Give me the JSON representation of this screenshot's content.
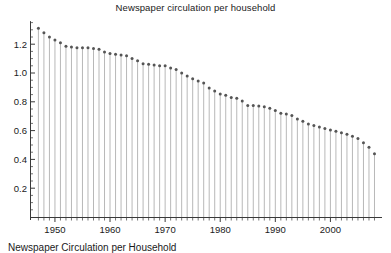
{
  "chart_data": {
    "type": "line",
    "plot_style": "stem",
    "title": "Newspaper circulation per household",
    "xlabel": "",
    "ylabel": "",
    "xlim": [
      1946.2,
      2009.0
    ],
    "ylim": [
      0,
      1.36
    ],
    "grid": false,
    "legend": null,
    "xticks": [
      1950,
      1960,
      1970,
      1980,
      1990,
      2000
    ],
    "xtick_labels": [
      "1950",
      "1960",
      "1970",
      "1980",
      "1990",
      "2000"
    ],
    "x_minor_tick_interval": 1,
    "yticks": [
      0.2,
      0.4,
      0.6,
      0.8,
      1.0,
      1.2
    ],
    "ytick_labels": [
      "0.2",
      "0.4",
      "0.6",
      "0.8",
      "1.0",
      "1.2"
    ],
    "y_minor_tick_interval": 0.05,
    "marker": "circle",
    "marker_color": "#555555",
    "stem_color": "#b0b0b0",
    "axis_color": "#3a3a3a",
    "x": [
      1947,
      1948,
      1949,
      1950,
      1951,
      1952,
      1953,
      1954,
      1955,
      1956,
      1957,
      1958,
      1959,
      1960,
      1961,
      1962,
      1963,
      1964,
      1965,
      1966,
      1967,
      1968,
      1969,
      1970,
      1971,
      1972,
      1973,
      1974,
      1975,
      1976,
      1977,
      1978,
      1979,
      1980,
      1981,
      1982,
      1983,
      1984,
      1985,
      1986,
      1987,
      1988,
      1989,
      1990,
      1991,
      1992,
      1993,
      1994,
      1995,
      1996,
      1997,
      1998,
      1999,
      2000,
      2001,
      2002,
      2003,
      2004,
      2005,
      2006,
      2007,
      2008
    ],
    "values": [
      1.31,
      1.28,
      1.25,
      1.23,
      1.21,
      1.185,
      1.18,
      1.175,
      1.175,
      1.175,
      1.17,
      1.165,
      1.145,
      1.135,
      1.13,
      1.125,
      1.12,
      1.1,
      1.085,
      1.065,
      1.06,
      1.055,
      1.05,
      1.05,
      1.035,
      1.025,
      1.0,
      0.98,
      0.96,
      0.945,
      0.93,
      0.895,
      0.875,
      0.855,
      0.845,
      0.83,
      0.825,
      0.805,
      0.775,
      0.775,
      0.77,
      0.765,
      0.755,
      0.74,
      0.72,
      0.715,
      0.705,
      0.68,
      0.665,
      0.645,
      0.635,
      0.625,
      0.615,
      0.605,
      0.595,
      0.585,
      0.575,
      0.56,
      0.545,
      0.515,
      0.485,
      0.44
    ]
  },
  "caption": {
    "text": "Newspaper Circulation per Household"
  }
}
